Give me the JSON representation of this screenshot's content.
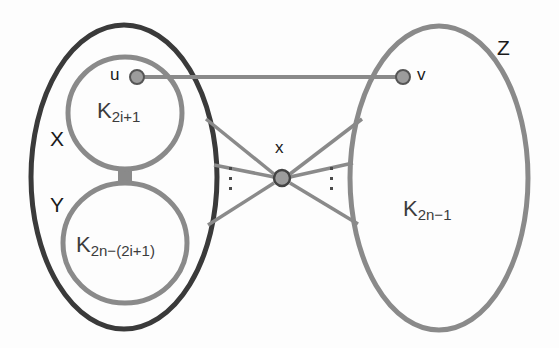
{
  "figure": {
    "type": "graph-diagram",
    "background_color": "#fdfdfd"
  },
  "colors": {
    "outer_ellipse_stroke": "#3a3a3a",
    "inner_circle_stroke": "#8a8a8a",
    "right_ellipse_stroke": "#8a8a8a",
    "edge_stroke": "#8a8a8a",
    "vertex_fill": "#9c9c9c",
    "vertex_stroke": "#555555",
    "text_color": "#1a1a1a",
    "clique_text_color": "#3c3c3c"
  },
  "sets": {
    "outer": {
      "name": "outer-set-XY",
      "shape": "ellipse",
      "cx": 124,
      "cy": 177,
      "rx": 93,
      "ry": 152,
      "stroke_width": 5
    },
    "x_label": {
      "text": "X",
      "x": 50,
      "y": 128
    },
    "y_label": {
      "text": "Y",
      "x": 50,
      "y": 194
    },
    "z": {
      "name": "set-Z",
      "shape": "ellipse",
      "cx": 439,
      "cy": 178,
      "rx": 89,
      "ry": 152,
      "stroke_width": 5
    },
    "z_label": {
      "text": "Z",
      "x": 497,
      "y": 37
    }
  },
  "cliques": [
    {
      "id": "clique-upper",
      "base": "K",
      "subscript": "2i+1",
      "shape": "ellipse",
      "cx": 125,
      "cy": 113,
      "rx": 57,
      "ry": 56,
      "label_x": 97,
      "label_y": 100
    },
    {
      "id": "clique-lower",
      "base": "K",
      "subscript": "2n−(2i+1)",
      "shape": "ellipse",
      "cx": 125,
      "cy": 243,
      "rx": 62,
      "ry": 60,
      "label_x": 76,
      "label_y": 234
    },
    {
      "id": "clique-right",
      "base": "K",
      "subscript": "2n−1",
      "shape": "ellipse",
      "cx": 439,
      "cy": 178,
      "rx": 89,
      "ry": 152,
      "label_x": 403,
      "label_y": 198
    }
  ],
  "connector_bar": {
    "name": "clique-join-bar",
    "x": 118,
    "y": 166,
    "width": 14,
    "height": 22
  },
  "vertices": [
    {
      "id": "u",
      "label": "u",
      "cx": 137,
      "cy": 77,
      "r": 7,
      "label_x": 110,
      "label_y": 66
    },
    {
      "id": "v",
      "label": "v",
      "cx": 403,
      "cy": 77,
      "r": 7,
      "label_x": 417,
      "label_y": 66
    },
    {
      "id": "x",
      "label": "x",
      "cx": 282,
      "cy": 178,
      "r": 8,
      "label_x": 275,
      "label_y": 139
    }
  ],
  "edges": [
    {
      "id": "edge-u-v",
      "from": "u",
      "to": "v",
      "x1": 144,
      "y1": 77,
      "x2": 396,
      "y2": 77
    },
    {
      "id": "edge-x-left-top",
      "from": "x",
      "to": "X-set",
      "x1": 274,
      "y1": 174,
      "x2": 206,
      "y2": 119
    },
    {
      "id": "edge-x-left-mid",
      "from": "x",
      "to": "X-set",
      "x1": 274,
      "y1": 177,
      "x2": 215,
      "y2": 165
    },
    {
      "id": "edge-x-left-bot",
      "from": "x",
      "to": "Y-set",
      "x1": 274,
      "y1": 183,
      "x2": 208,
      "y2": 225
    },
    {
      "id": "edge-x-right-top",
      "from": "x",
      "to": "Z-set",
      "x1": 290,
      "y1": 174,
      "x2": 362,
      "y2": 119
    },
    {
      "id": "edge-x-right-mid",
      "from": "x",
      "to": "Z-set",
      "x1": 290,
      "y1": 177,
      "x2": 352,
      "y2": 163
    },
    {
      "id": "edge-x-right-bot",
      "from": "x",
      "to": "Z-set",
      "x1": 290,
      "y1": 183,
      "x2": 358,
      "y2": 224
    }
  ],
  "ellipses_dots": [
    {
      "id": "dots-left",
      "x": 229,
      "y": 167,
      "count": 3
    },
    {
      "id": "dots-right",
      "x": 330,
      "y": 167,
      "count": 3
    }
  ]
}
